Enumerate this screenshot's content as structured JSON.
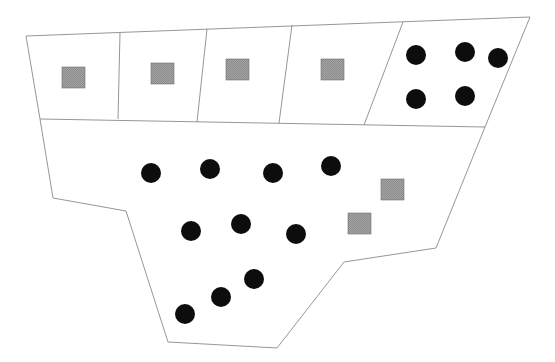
{
  "diagram": {
    "width": 555,
    "height": 362,
    "colors": {
      "background": "#ffffff",
      "outline": "#8a8a8a",
      "circle_fill": "#0d0d0d",
      "square_fill": "#9a9a9a",
      "square_border": "#6f6f6f"
    },
    "outer_boundary": [
      [
        26,
        36
      ],
      [
        530,
        17
      ],
      [
        485,
        127
      ],
      [
        436,
        248
      ],
      [
        344,
        262
      ],
      [
        277,
        348
      ],
      [
        168,
        342
      ],
      [
        126,
        211
      ],
      [
        53,
        198
      ],
      [
        40,
        119
      ]
    ],
    "middle_line": [
      [
        40,
        119
      ],
      [
        485,
        127
      ]
    ],
    "top_row_dividers": [
      [
        [
          120,
          33
        ],
        [
          118,
          119
        ]
      ],
      [
        [
          207,
          29
        ],
        [
          197,
          122
        ]
      ],
      [
        [
          292,
          25
        ],
        [
          279,
          123
        ]
      ],
      [
        [
          403,
          22
        ],
        [
          364,
          125
        ]
      ]
    ],
    "top_cells": [
      {
        "label": "cell-1",
        "squares": 1,
        "circles": 0
      },
      {
        "label": "cell-2",
        "squares": 1,
        "circles": 0
      },
      {
        "label": "cell-3",
        "squares": 1,
        "circles": 0
      },
      {
        "label": "cell-4",
        "squares": 1,
        "circles": 0
      },
      {
        "label": "cell-5",
        "squares": 0,
        "circles": 5
      }
    ],
    "bottom_region": {
      "squares": 2,
      "circles": 10
    },
    "squares": [
      {
        "x": 62,
        "y": 67,
        "size": 23
      },
      {
        "x": 151,
        "y": 63,
        "size": 23
      },
      {
        "x": 226,
        "y": 59,
        "size": 23
      },
      {
        "x": 321,
        "y": 59,
        "size": 23
      },
      {
        "x": 381,
        "y": 179,
        "size": 23
      },
      {
        "x": 348,
        "y": 213,
        "size": 23
      }
    ],
    "circles": [
      {
        "cx": 416,
        "cy": 55,
        "r": 10
      },
      {
        "cx": 465,
        "cy": 52,
        "r": 10
      },
      {
        "cx": 498,
        "cy": 58,
        "r": 10
      },
      {
        "cx": 416,
        "cy": 99,
        "r": 10
      },
      {
        "cx": 465,
        "cy": 96,
        "r": 10
      },
      {
        "cx": 151,
        "cy": 173,
        "r": 10
      },
      {
        "cx": 210,
        "cy": 169,
        "r": 10
      },
      {
        "cx": 273,
        "cy": 173,
        "r": 10
      },
      {
        "cx": 331,
        "cy": 166,
        "r": 10
      },
      {
        "cx": 191,
        "cy": 231,
        "r": 10
      },
      {
        "cx": 241,
        "cy": 224,
        "r": 10
      },
      {
        "cx": 296,
        "cy": 234,
        "r": 10
      },
      {
        "cx": 254,
        "cy": 279,
        "r": 10
      },
      {
        "cx": 221,
        "cy": 297,
        "r": 10
      },
      {
        "cx": 185,
        "cy": 314,
        "r": 10
      }
    ]
  }
}
